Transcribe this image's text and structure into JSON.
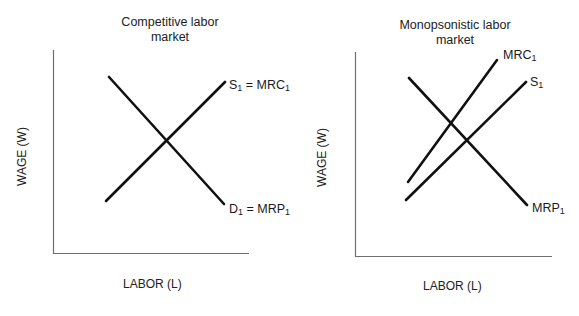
{
  "colors": {
    "line": "#111111",
    "axis": "#6f6f6f",
    "text": "#222222",
    "background": "#ffffff"
  },
  "panels": [
    {
      "id": "competitive",
      "title_line1": "Competitive labor",
      "title_line2": "market",
      "y_axis_label": "WAGE (W)",
      "x_axis_label": "LABOR (L)",
      "curves": [
        {
          "name": "demand",
          "label_main": "D",
          "label_sub": "1",
          "label_rest": " = MRP",
          "label_rest_sub": "1",
          "type": "downward",
          "from": [
            109,
            77
          ],
          "to": [
            224,
            204
          ]
        },
        {
          "name": "supply",
          "label_main": "S",
          "label_sub": "1",
          "label_rest": " = MRC",
          "label_rest_sub": "1",
          "type": "upward",
          "from": [
            106,
            201
          ],
          "to": [
            225,
            82
          ]
        }
      ]
    },
    {
      "id": "monopsonistic",
      "title_line1": "Monopsonistic labor",
      "title_line2": "market",
      "y_axis_label": "WAGE (W)",
      "x_axis_label": "LABOR (L)",
      "curves": [
        {
          "name": "mrp",
          "label_main": "MRP",
          "label_sub": "1",
          "type": "downward",
          "from": [
            409,
            78
          ],
          "to": [
            527,
            205
          ]
        },
        {
          "name": "mrc",
          "label_main": "MRC",
          "label_sub": "1",
          "type": "upward",
          "from": [
            408,
            182
          ],
          "to": [
            497,
            60
          ]
        },
        {
          "name": "supply",
          "label_main": "S",
          "label_sub": "1",
          "type": "upward",
          "from": [
            406,
            200
          ],
          "to": [
            526,
            82
          ]
        }
      ]
    }
  ]
}
